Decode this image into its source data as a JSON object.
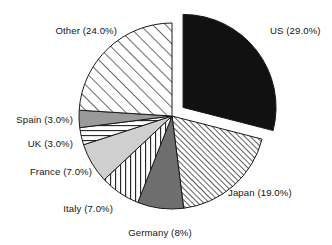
{
  "chart_data": {
    "type": "pie",
    "title": "",
    "subtitle": "",
    "xlabel": "",
    "ylabel": "",
    "legend_position": "none",
    "grid": false,
    "start_angle_deg": 90,
    "direction": "clockwise",
    "categories": [
      "US",
      "Japan",
      "Germany",
      "Italy",
      "France",
      "UK",
      "Spain",
      "Other"
    ],
    "values": [
      29.0,
      19.0,
      8.0,
      7.0,
      7.0,
      3.0,
      3.0,
      24.0
    ],
    "labels": [
      "US (29.0%)",
      "Japan (19.0%)",
      "Germany (8%)",
      "Italy (7.0%)",
      "France (7.0%)",
      "UK (3.0%)",
      "Spain (3.0%)",
      "Other (24.0%)"
    ],
    "slices": [
      {
        "name": "US",
        "value": 29.0,
        "label": "US (29.0%)",
        "fill": "solid-black",
        "color": "#111111",
        "exploded": true
      },
      {
        "name": "Japan",
        "value": 19.0,
        "label": "Japan (19.0%)",
        "fill": "diagonal-fine",
        "color": "#ffffff",
        "exploded": false
      },
      {
        "name": "Germany",
        "value": 8.0,
        "label": "Germany (8%)",
        "fill": "solid-dark-gray",
        "color": "#6e6e6e",
        "exploded": false
      },
      {
        "name": "Italy",
        "value": 7.0,
        "label": "Italy (7.0%)",
        "fill": "vertical-lines",
        "color": "#ffffff",
        "exploded": false
      },
      {
        "name": "France",
        "value": 7.0,
        "label": "France (7.0%)",
        "fill": "solid-light-gray",
        "color": "#cfcfcf",
        "exploded": false
      },
      {
        "name": "UK",
        "value": 3.0,
        "label": "UK (3.0%)",
        "fill": "horizontal-lines",
        "color": "#ffffff",
        "exploded": false
      },
      {
        "name": "Spain",
        "value": 3.0,
        "label": "Spain (3.0%)",
        "fill": "solid-medium-gray",
        "color": "#9a9a9a",
        "exploded": false
      },
      {
        "name": "Other",
        "value": 24.0,
        "label": "Other (24.0%)",
        "fill": "diagonal-wide",
        "color": "#ffffff",
        "exploded": false
      }
    ],
    "total": 100.0,
    "units": "percent",
    "background_color": "#ffffff",
    "outline_color": "#1a1a1a"
  },
  "labels": {
    "us": "US (29.0%)",
    "japan": "Japan (19.0%)",
    "germany": "Germany (8%)",
    "italy": "Italy (7.0%)",
    "france": "France (7.0%)",
    "uk": "UK (3.0%)",
    "spain": "Spain (3.0%)",
    "other": "Other (24.0%)"
  }
}
